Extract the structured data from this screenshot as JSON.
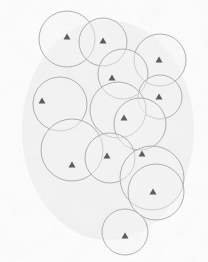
{
  "figure": {
    "width": 208,
    "height": 262,
    "background_color": "#ffffff",
    "circle_stroke_color": "#b0aeb0",
    "circle_fill_color": "#f7f6f6",
    "circle_stroke_width": 1,
    "marker_color": "#595959",
    "marker_shape": "triangle-up",
    "marker_size": 7,
    "noise_color": "#e8e7e6"
  },
  "chart_data": {
    "type": "scatter",
    "xlabel": "",
    "ylabel": "",
    "xlim": [
      0,
      208
    ],
    "ylim": [
      0,
      262
    ],
    "grid": false,
    "legend": "none",
    "series": [
      {
        "name": "nodes",
        "marker": "triangle-up",
        "color": "#595959",
        "points": [
          {
            "id": "n1",
            "x": 67,
            "y": 37
          },
          {
            "id": "n2",
            "x": 103,
            "y": 41
          },
          {
            "id": "n3",
            "x": 159,
            "y": 60
          },
          {
            "id": "n4",
            "x": 112,
            "y": 78
          },
          {
            "id": "n5",
            "x": 159,
            "y": 97
          },
          {
            "id": "n6",
            "x": 42,
            "y": 101
          },
          {
            "id": "n7",
            "x": 124,
            "y": 118
          },
          {
            "id": "n8",
            "x": 142,
            "y": 154
          },
          {
            "id": "n9",
            "x": 107,
            "y": 156
          },
          {
            "id": "n10",
            "x": 72,
            "y": 165
          },
          {
            "id": "n11",
            "x": 153,
            "y": 192
          },
          {
            "id": "n12",
            "x": 125,
            "y": 236
          }
        ]
      },
      {
        "name": "coverage_circles",
        "marker": "circle-outline",
        "color": "#b0aeb0",
        "circles": [
          {
            "id": "c1",
            "cx": 67,
            "cy": 39,
            "r": 28
          },
          {
            "id": "c2",
            "cx": 103,
            "cy": 42,
            "r": 24
          },
          {
            "id": "c3",
            "cx": 160,
            "cy": 60,
            "r": 26
          },
          {
            "id": "c4",
            "cx": 123,
            "cy": 74,
            "r": 25
          },
          {
            "id": "c5",
            "cx": 160,
            "cy": 97,
            "r": 22
          },
          {
            "id": "c6",
            "cx": 60,
            "cy": 104,
            "r": 27
          },
          {
            "id": "c7",
            "cx": 118,
            "cy": 110,
            "r": 28
          },
          {
            "id": "c8",
            "cx": 140,
            "cy": 124,
            "r": 26
          },
          {
            "id": "c9",
            "cx": 72,
            "cy": 150,
            "r": 31
          },
          {
            "id": "c10",
            "cx": 110,
            "cy": 158,
            "r": 25
          },
          {
            "id": "c11",
            "cx": 152,
            "cy": 178,
            "r": 32
          },
          {
            "id": "c12",
            "cx": 156,
            "cy": 192,
            "r": 28
          },
          {
            "id": "c13",
            "cx": 125,
            "cy": 232,
            "r": 23
          }
        ]
      }
    ],
    "annotations": []
  }
}
